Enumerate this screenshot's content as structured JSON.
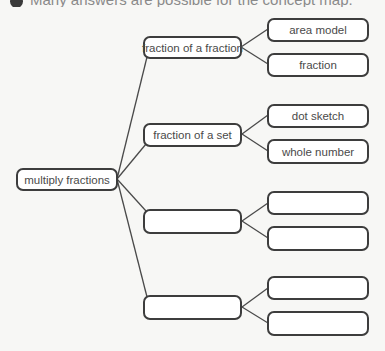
{
  "header": {
    "instruction_text": "Many answers are possible for the concept map."
  },
  "diagram": {
    "root": {
      "label": "multiply fractions"
    },
    "branches": [
      {
        "label": "fraction of a fraction",
        "children": [
          {
            "label": "area model"
          },
          {
            "label": "fraction"
          }
        ]
      },
      {
        "label": "fraction of a set",
        "children": [
          {
            "label": "dot sketch"
          },
          {
            "label": "whole number"
          }
        ]
      },
      {
        "label": "",
        "children": [
          {
            "label": ""
          },
          {
            "label": ""
          }
        ]
      },
      {
        "label": "",
        "children": [
          {
            "label": ""
          },
          {
            "label": ""
          }
        ]
      }
    ],
    "colors": {
      "border": "#3d3d3d",
      "text": "#4a4a4a",
      "background": "#f7f7f5",
      "box_fill": "#ffffff"
    }
  }
}
